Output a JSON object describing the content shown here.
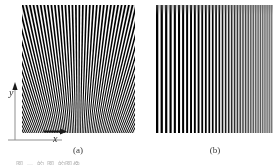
{
  "figure": {
    "background_color": "#ffffff",
    "ink_color": "#000000"
  },
  "panels": [
    {
      "id": "a",
      "caption": "(a)",
      "pattern_type": "radial-fan-grating",
      "description": "Sinusoidal fan of light and dark stripes radiating from a vanishing point below the image; stripes are near vertical at the centre and tilt outward toward both edges.",
      "orientation": "radial",
      "stripe_count": 64,
      "fan_center_x_pct": 50,
      "fan_center_y_pct": 185,
      "fan_half_angle_deg": 27,
      "contrast": "high",
      "corner_shading": "darkened vignette at corners and edges"
    },
    {
      "id": "b",
      "caption": "(b)",
      "pattern_type": "vertical-chirp-grating",
      "description": "Strictly vertical stripes whose spatial frequency increases from left to right while contrast falls off toward the right.",
      "orientation": "vertical",
      "stripe_count": 58,
      "frequency_left": "low",
      "frequency_right": "high",
      "contrast_left": "high",
      "contrast_right": "low",
      "shading": "grey wash increasing toward the right edge"
    }
  ],
  "axes": {
    "x_label": "x",
    "y_label": "y",
    "x_direction": "right",
    "y_direction": "up",
    "origin_description": "lower-left corner of panel (a)",
    "line_color": "#8a8a8a",
    "arrow_color": "#1a1a1a"
  },
  "footer": {
    "text": "图 — 的 图 的图像",
    "note": "line of caption text clipped by the bottom edge of the screenshot"
  }
}
